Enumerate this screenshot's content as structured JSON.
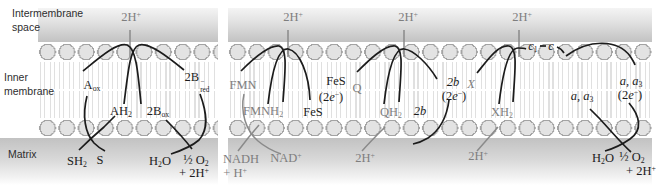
{
  "colors": {
    "arrow_black": "#1c1c1c",
    "arrow_gray": "#8a8a8a",
    "label_black": "#1c1c1c",
    "label_gray": "#7e7e7e",
    "membrane_head_fill": "#e3e3e3",
    "membrane_head_stroke": "#a3a3a3",
    "band_gray_dark": "#c2c2c2",
    "band_gray_light": "#f4f4f4"
  },
  "regions": {
    "intermembrane": {
      "line1": "Intermembrane",
      "line2": "space"
    },
    "inner": {
      "line1": "Inner",
      "line2": "membrane"
    },
    "matrix": "Matrix"
  },
  "shared": {
    "proton": {
      "base": "2H",
      "sup": "+"
    },
    "two_e": {
      "open": "(2",
      "e": "e",
      "sup": "−",
      "close": ")"
    },
    "h2o": {
      "base": "H",
      "sub": "2",
      "tail": "O"
    },
    "half_o2": {
      "base": "½ O",
      "sub": "2"
    },
    "plus_2h": {
      "base": "+ 2H",
      "sup": "+"
    }
  },
  "left": {
    "a_ox": {
      "base": "A",
      "sub": "ox"
    },
    "b_red": {
      "base": "2B",
      "sup": "−",
      "sub": "red"
    },
    "ah2": {
      "base": "AH",
      "sub": "2"
    },
    "b_ox": {
      "base": "2B",
      "sub": "ox"
    },
    "sh2": {
      "base": "SH",
      "sub": "2"
    },
    "s": "S"
  },
  "right": {
    "fmn": "FMN",
    "fmnh2": {
      "base": "FMNH",
      "sub": "2"
    },
    "fes": "FeS",
    "q": "Q",
    "qh2": {
      "base": "QH",
      "sub": "2"
    },
    "b2": "2b",
    "x": "X",
    "xh2": {
      "base": "XH",
      "sub": "2"
    },
    "c1": {
      "base": "c",
      "sub": "1"
    },
    "c": "c",
    "aa3": {
      "base": "a, a",
      "sub": "3"
    },
    "nadh": "NADH",
    "plus_h": {
      "base": "+ H",
      "sup": "+"
    },
    "nad": {
      "base": "NAD",
      "sup": "+"
    }
  }
}
